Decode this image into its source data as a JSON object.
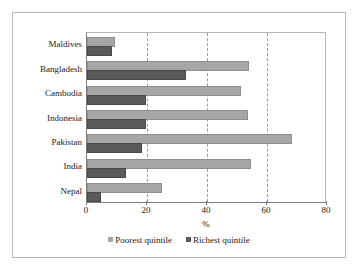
{
  "chart_data": {
    "type": "bar",
    "orientation": "horizontal",
    "title": "",
    "xlabel": "%",
    "ylabel": "",
    "xlim": [
      0,
      80
    ],
    "xticks": [
      0,
      20,
      40,
      60,
      80
    ],
    "grid": "vertical-dashed",
    "legend_position": "bottom",
    "categories": [
      "Maldives",
      "Bangladesh",
      "Cambodia",
      "Indonesia",
      "Pakistan",
      "India",
      "Nepal"
    ],
    "series": [
      {
        "name": "Poorest quintile",
        "color": "#a6a6a6",
        "values": [
          8.5,
          53.3,
          50.7,
          53.0,
          67.7,
          54.0,
          24.3
        ]
      },
      {
        "name": "Richest quintile",
        "color": "#5a5a5a",
        "values": [
          7.5,
          32.3,
          19.0,
          19.0,
          17.7,
          12.3,
          4.0
        ]
      }
    ]
  },
  "axis": {
    "x_title": "%",
    "tick_labels": [
      "0",
      "20",
      "40",
      "60",
      "80"
    ]
  },
  "legend": {
    "items": [
      {
        "label": "Poorest quintile",
        "swatch": "poorest"
      },
      {
        "label": "Richest quintile",
        "swatch": "richest"
      }
    ]
  },
  "colors": {
    "poorest": "#a6a6a6",
    "richest": "#5a5a5a",
    "frame": "#b9b9b9",
    "axis": "#7d7d7d",
    "grid": "#9a9a9a"
  }
}
